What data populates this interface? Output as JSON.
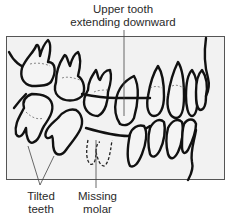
{
  "diagram": {
    "labels": {
      "upper_tooth": [
        "Upper tooth",
        "extending downward"
      ],
      "tilted_teeth": [
        "Tilted",
        "teeth"
      ],
      "missing_molar": [
        "Missing",
        "molar"
      ]
    },
    "colors": {
      "frame_fill": "#f2f2f2",
      "frame_stroke": "#555555",
      "tooth_stroke": "#111111",
      "tooth_fill": "#f4f4f4",
      "leader_line": "#444444"
    }
  }
}
